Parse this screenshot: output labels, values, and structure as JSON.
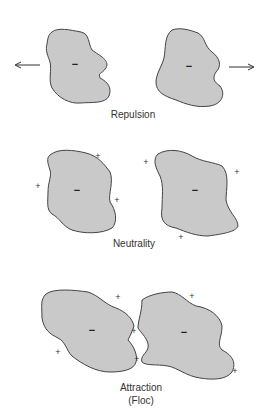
{
  "colors": {
    "particle_fill": "#c9c9c9",
    "particle_stroke": "#444444",
    "text": "#333333",
    "background": "#ffffff"
  },
  "panels": [
    {
      "id": "repulsion",
      "label": "Repulsion",
      "particle_charge": "−",
      "arrows": [
        "left",
        "right"
      ],
      "counter_ions": []
    },
    {
      "id": "neutrality",
      "label": "Neutrality",
      "particle_charge": "−",
      "counter_ions": [
        "+",
        "+",
        "+",
        "+",
        "+",
        "+"
      ]
    },
    {
      "id": "attraction",
      "label_line1": "Attraction",
      "label_line2": "(Floc)",
      "particle_charge": "−",
      "counter_ions": [
        "+",
        "+",
        "+",
        "+",
        "+",
        "+"
      ]
    }
  ],
  "labels": {
    "repulsion": "Repulsion",
    "neutrality": "Neutrality",
    "attraction_line1": "Attraction",
    "attraction_line2": "(Floc)"
  },
  "signs": {
    "minus": "−",
    "plus": "+"
  }
}
